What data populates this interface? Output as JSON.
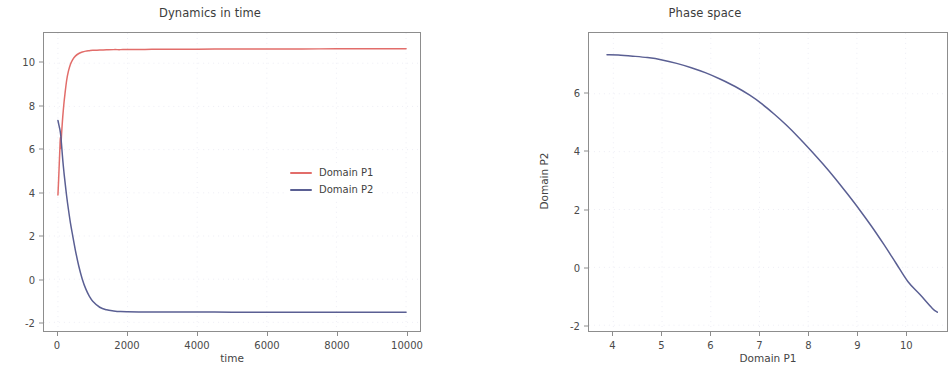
{
  "figure": {
    "background": "#ffffff",
    "axis_color": "#8d8d8d",
    "text_color": "#444444"
  },
  "panels": {
    "dynamics": {
      "title": "Dynamics in time",
      "xlabel": "time",
      "ylabel": "",
      "xticks": [
        "0",
        "2000",
        "4000",
        "6000",
        "8000",
        "10000"
      ],
      "yticks": [
        "10",
        "8",
        "6",
        "4",
        "2",
        "0",
        "-2"
      ],
      "legend": [
        {
          "label": "Domain P1",
          "color": "#e26d6a"
        },
        {
          "label": "Domain P2",
          "color": "#5a5f93"
        }
      ]
    },
    "phase": {
      "title": "Phase space",
      "xlabel": "Domain P1",
      "ylabel": "Domain P2",
      "xticks": [
        "4",
        "5",
        "6",
        "7",
        "8",
        "9",
        "10"
      ],
      "yticks": [
        "6",
        "4",
        "2",
        "0",
        "-2"
      ]
    }
  },
  "chart_data": [
    {
      "type": "line",
      "title": "Dynamics in time",
      "xlabel": "time",
      "ylabel": "",
      "xlim": [
        -400,
        10400
      ],
      "ylim": [
        -2.4,
        11.4
      ],
      "xticks": [
        0,
        2000,
        4000,
        6000,
        8000,
        10000
      ],
      "yticks": [
        10,
        8,
        6,
        4,
        2,
        0,
        -2
      ],
      "grid": true,
      "legend_position": "center-right",
      "series": [
        {
          "name": "Domain P1",
          "color": "#e26d6a",
          "x": [
            0,
            20,
            40,
            55,
            70,
            85,
            100,
            120,
            140,
            170,
            200,
            250,
            300,
            360,
            420,
            500,
            600,
            700,
            800,
            900,
            1000,
            1200,
            1400,
            1600,
            1800,
            2000,
            2500,
            3000,
            4000,
            5000,
            6000,
            7000,
            8000,
            9000,
            10000
          ],
          "y": [
            3.9,
            4.6,
            5.4,
            6.0,
            6.55,
            6.05,
            6.6,
            7.1,
            7.55,
            8.1,
            8.55,
            9.2,
            9.62,
            9.95,
            10.16,
            10.33,
            10.45,
            10.52,
            10.56,
            10.58,
            10.6,
            10.61,
            10.62,
            10.63,
            10.63,
            10.64,
            10.64,
            10.65,
            10.65,
            10.66,
            10.66,
            10.66,
            10.67,
            10.67,
            10.67
          ]
        },
        {
          "name": "Domain P2",
          "color": "#5a5f93",
          "x": [
            0,
            20,
            40,
            55,
            70,
            85,
            100,
            120,
            140,
            170,
            200,
            250,
            300,
            360,
            420,
            500,
            600,
            700,
            800,
            900,
            1000,
            1200,
            1400,
            1600,
            1800,
            2000,
            2500,
            3000,
            4000,
            5000,
            6000,
            7000,
            8000,
            9000,
            10000
          ],
          "y": [
            7.35,
            7.2,
            7.05,
            6.95,
            6.8,
            6.6,
            6.3,
            5.9,
            5.5,
            5.0,
            4.55,
            3.85,
            3.25,
            2.6,
            2.05,
            1.35,
            0.6,
            0.0,
            -0.45,
            -0.78,
            -1.02,
            -1.3,
            -1.42,
            -1.47,
            -1.5,
            -1.51,
            -1.52,
            -1.52,
            -1.52,
            -1.53,
            -1.53,
            -1.53,
            -1.53,
            -1.53,
            -1.53
          ]
        }
      ]
    },
    {
      "type": "line",
      "title": "Phase space",
      "xlabel": "Domain P1",
      "ylabel": "Domain P2",
      "xlim": [
        3.5,
        10.85
      ],
      "ylim": [
        -2.2,
        8.1
      ],
      "xticks": [
        4,
        5,
        6,
        7,
        8,
        9,
        10
      ],
      "yticks": [
        6,
        4,
        2,
        0,
        -2
      ],
      "grid": true,
      "series": [
        {
          "name": "trajectory",
          "color": "#5a5f93",
          "x": [
            3.87,
            4.1,
            4.4,
            4.7,
            5.0,
            5.3,
            5.6,
            5.9,
            6.2,
            6.5,
            6.8,
            7.05,
            7.3,
            7.55,
            7.8,
            8.05,
            8.3,
            8.55,
            8.8,
            9.05,
            9.3,
            9.55,
            9.8,
            10.05,
            10.3,
            10.55,
            10.65
          ],
          "y": [
            7.35,
            7.34,
            7.3,
            7.25,
            7.17,
            7.05,
            6.9,
            6.72,
            6.5,
            6.25,
            5.95,
            5.65,
            5.3,
            4.92,
            4.5,
            4.05,
            3.58,
            3.08,
            2.55,
            2.0,
            1.42,
            0.8,
            0.15,
            -0.5,
            -0.95,
            -1.42,
            -1.55
          ]
        }
      ]
    }
  ]
}
